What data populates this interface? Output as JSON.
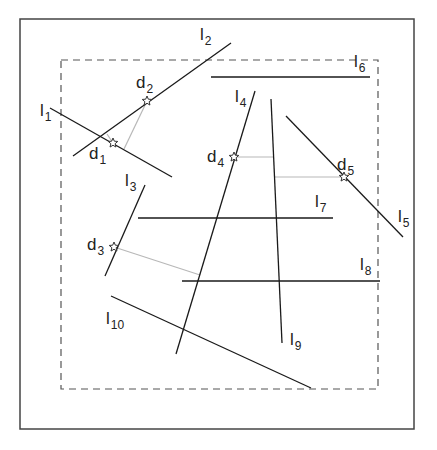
{
  "diagram": {
    "outer_frame": {
      "x1": 20,
      "y1": 19,
      "x2": 414,
      "y2": 429,
      "color": "#444444"
    },
    "dashed_region": {
      "x1": 61,
      "y1": 60,
      "x2": 378,
      "y2": 389,
      "color": "#555555"
    },
    "lines": [
      {
        "id": "l1",
        "base": "l",
        "sub": "1",
        "x1": 50,
        "y1": 108,
        "x2": 172,
        "y2": 177,
        "label_x": 40,
        "label_y": 116
      },
      {
        "id": "l2",
        "base": "l",
        "sub": "2",
        "x1": 73,
        "y1": 156,
        "x2": 231,
        "y2": 43,
        "label_x": 200,
        "label_y": 40
      },
      {
        "id": "l3",
        "base": "l",
        "sub": "3",
        "x1": 145,
        "y1": 185,
        "x2": 105,
        "y2": 276,
        "label_x": 125,
        "label_y": 186
      },
      {
        "id": "l4",
        "base": "l",
        "sub": "4",
        "x1": 255,
        "y1": 91,
        "x2": 176,
        "y2": 354,
        "label_x": 235,
        "label_y": 102
      },
      {
        "id": "l5",
        "base": "l",
        "sub": "5",
        "x1": 286,
        "y1": 116,
        "x2": 403,
        "y2": 237,
        "label_x": 398,
        "label_y": 222
      },
      {
        "id": "l6",
        "base": "l",
        "sub": "6",
        "x1": 211,
        "y1": 77,
        "x2": 370,
        "y2": 77,
        "label_x": 354,
        "label_y": 67
      },
      {
        "id": "l7",
        "base": "l",
        "sub": "7",
        "x1": 138,
        "y1": 218,
        "x2": 333,
        "y2": 218,
        "label_x": 315,
        "label_y": 207
      },
      {
        "id": "l8",
        "base": "l",
        "sub": "8",
        "x1": 182,
        "y1": 281,
        "x2": 380,
        "y2": 281,
        "label_x": 360,
        "label_y": 270
      },
      {
        "id": "l9",
        "base": "l",
        "sub": "9",
        "x1": 271,
        "y1": 99,
        "x2": 282,
        "y2": 343,
        "label_x": 290,
        "label_y": 345
      },
      {
        "id": "l10",
        "base": "l",
        "sub": "10",
        "x1": 111,
        "y1": 296,
        "x2": 311,
        "y2": 388,
        "label_x": 106,
        "label_y": 324
      }
    ],
    "points": [
      {
        "id": "d1",
        "base": "d",
        "sub": "1",
        "x": 113,
        "y": 143,
        "label_x": 89,
        "label_y": 159
      },
      {
        "id": "d2",
        "base": "d",
        "sub": "2",
        "x": 147,
        "y": 101,
        "label_x": 136,
        "label_y": 88
      },
      {
        "id": "d3",
        "base": "d",
        "sub": "3",
        "x": 114,
        "y": 247,
        "label_x": 87,
        "label_y": 250
      },
      {
        "id": "d4",
        "base": "d",
        "sub": "4",
        "x": 234,
        "y": 157,
        "label_x": 207,
        "label_y": 162
      },
      {
        "id": "d5",
        "base": "d",
        "sub": "5",
        "x": 344,
        "y": 177,
        "label_x": 337,
        "label_y": 170
      }
    ],
    "connectors": [
      {
        "from": "d1",
        "x1": 113,
        "y1": 143,
        "x2": 107,
        "y2": 134
      },
      {
        "from": "d2",
        "x1": 147,
        "y1": 101,
        "x2": 124,
        "y2": 149
      },
      {
        "from": "d3",
        "x1": 114,
        "y1": 247,
        "x2": 200,
        "y2": 275
      },
      {
        "from": "d4",
        "x1": 234,
        "y1": 157,
        "x2": 273,
        "y2": 157
      },
      {
        "from": "d5",
        "x1": 344,
        "y1": 177,
        "x2": 275,
        "y2": 177
      }
    ],
    "line_color": "#1a1a1a",
    "connector_color": "#b8b8b8",
    "star_color": "#333333"
  }
}
